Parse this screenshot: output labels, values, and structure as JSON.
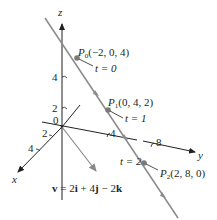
{
  "axes": {
    "z_label": "z",
    "x_label": "x",
    "y_label": "y",
    "origin_label": "0",
    "z_ticks": [
      "4",
      "2"
    ],
    "x_ticks": [
      "2",
      "4"
    ],
    "y_ticks": [
      "4",
      "8"
    ]
  },
  "points": [
    {
      "name": "P",
      "sub": "0",
      "coords": "(−2, 0, 4)",
      "t_label": "t = 0"
    },
    {
      "name": "P",
      "sub": "1",
      "coords": "(0, 4, 2)",
      "t_label": "t = 1"
    },
    {
      "name": "P",
      "sub": "2",
      "coords": "(2, 8, 0)",
      "t_label": "t = 2"
    }
  ],
  "vector_label": "v = 2i + 4j − 2k",
  "colors": {
    "axis": "#231f20",
    "line": "#8a8a8a",
    "point": "#7a7a7a",
    "vector": "#8a8a8a",
    "text": "#231f20"
  }
}
